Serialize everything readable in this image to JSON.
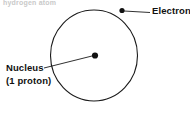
{
  "figure": {
    "title_fragment": "hydrogen atom",
    "background_color": "#ffffff",
    "stroke_color": "#1a1a1a",
    "text_color": "#111111",
    "width": 190,
    "height": 115
  },
  "orbit": {
    "name": "electron-orbit",
    "center_x": 94,
    "center_y": 55.5,
    "radius_x": 43.5,
    "radius_y": 45.5,
    "stroke_width": 1.1
  },
  "nucleus": {
    "label_line1": "Nucleus",
    "label_line2": "(1 proton)",
    "dot_x": 95,
    "dot_y": 55.5,
    "dot_radius": 3.1,
    "label_x": 6,
    "label_y1": 71,
    "label_y2": 84,
    "leader_from_x": 44,
    "leader_from_y": 68,
    "leader_to_x": 92,
    "leader_to_y": 56
  },
  "electron": {
    "label": "Electron",
    "dot_x": 122,
    "dot_y": 10.5,
    "dot_radius": 2.6,
    "label_x": 152,
    "label_y": 14,
    "leader_from_x": 124,
    "leader_from_y": 11,
    "leader_to_x": 150,
    "leader_to_y": 12.5
  }
}
